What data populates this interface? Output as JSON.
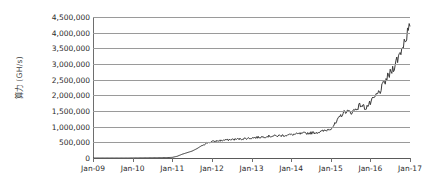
{
  "chart_data": {
    "type": "line",
    "title": "",
    "subtitle": "",
    "xlabel": "",
    "ylabel": "算力 (GH/s)",
    "ylabel_parts": {
      "name": "算力",
      "unit": "(GH/s)"
    },
    "legend": [],
    "legend_position": "none",
    "grid": true,
    "grid_axis": "y",
    "series_color": "#3a3a3a",
    "grid_color": "#9a9a9a",
    "axis_color": "#6e6e6e",
    "text_color": "#2b2b2b",
    "ylim": [
      0,
      4500000
    ],
    "ytick_values": [
      0,
      500000,
      1000000,
      1500000,
      2000000,
      2500000,
      3000000,
      3500000,
      4000000,
      4500000
    ],
    "ytick_labels": [
      "0",
      "500,000",
      "1,000,000",
      "1,500,000",
      "2,000,000",
      "2,500,000",
      "3,000,000",
      "3,500,000",
      "4,000,000",
      "4,500,000"
    ],
    "xtick_labels": [
      "Jan-09",
      "Jan-10",
      "Jan-11",
      "Jan-12",
      "Jan-13",
      "Jan-14",
      "Jan-15",
      "Jan-16",
      "Jan-17"
    ],
    "xlim": [
      "Jan-09",
      "Jan-17"
    ],
    "x": [
      "Jan-09",
      "Apr-09",
      "Jul-09",
      "Oct-09",
      "Jan-10",
      "Apr-10",
      "Jul-10",
      "Oct-10",
      "Jan-11",
      "Apr-11",
      "Jul-11",
      "Oct-11",
      "Jan-12",
      "Apr-12",
      "Jul-12",
      "Oct-12",
      "Jan-13",
      "Apr-13",
      "Jul-13",
      "Aug-13",
      "Sep-13",
      "Oct-13",
      "Nov-13",
      "Dec-13",
      "Jan-14",
      "Feb-14",
      "Mar-14",
      "Apr-14",
      "May-14",
      "Jun-14",
      "Jul-14",
      "Aug-14",
      "Sep-14",
      "Oct-14",
      "Nov-14",
      "Dec-14",
      "Jan-15",
      "Feb-15",
      "Mar-15",
      "Apr-15",
      "May-15",
      "Jun-15",
      "Jul-15",
      "Aug-15",
      "Sep-15",
      "Oct-15",
      "Nov-15",
      "Dec-15",
      "Jan-16",
      "Feb-16",
      "Mar-16",
      "Apr-16",
      "May-16",
      "Jun-16",
      "Jul-16",
      "Aug-16",
      "Sep-16",
      "Oct-16",
      "Nov-16",
      "Dec-16",
      "Jan-17",
      "Feb-17",
      "Mar-17",
      "Apr-17",
      "May-17"
    ],
    "values": [
      0,
      0,
      0,
      0,
      0,
      0,
      0,
      0,
      2000,
      3000,
      5000,
      6000,
      8000,
      9000,
      11000,
      14000,
      20000,
      55000,
      120000,
      170000,
      220000,
      300000,
      400000,
      480000,
      520000,
      545000,
      560000,
      575000,
      590000,
      600000,
      610000,
      625000,
      640000,
      655000,
      670000,
      690000,
      700000,
      705000,
      715000,
      730000,
      745000,
      760000,
      775000,
      790000,
      800000,
      815000,
      840000,
      880000,
      950000,
      1100000,
      1350000,
      1500000,
      1450000,
      1550000,
      1700000,
      1600000,
      1750000,
      1950000,
      2150000,
      2450000,
      2700000,
      3000000,
      3350000,
      3800000,
      4200000
    ],
    "peak_value": 4200000,
    "peak_label": "Jan-17"
  }
}
